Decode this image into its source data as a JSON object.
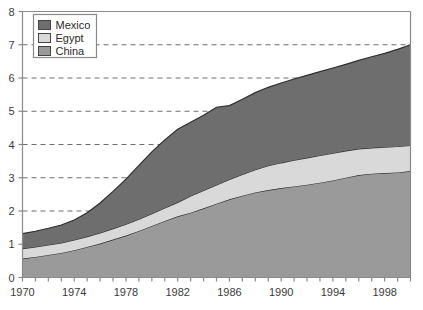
{
  "chart_data": {
    "type": "area",
    "stacked": true,
    "title": "",
    "xlabel": "",
    "ylabel": "",
    "xlim": [
      1970,
      2000
    ],
    "ylim": [
      0,
      8
    ],
    "ytick_values": [
      0,
      1,
      2,
      3,
      4,
      5,
      6,
      7,
      8
    ],
    "ytick_labels": [
      "0",
      "1",
      "2",
      "3",
      "4",
      "5",
      "6",
      "7",
      "8"
    ],
    "xtick_values": [
      1970,
      1971,
      1972,
      1973,
      1974,
      1975,
      1976,
      1977,
      1978,
      1979,
      1980,
      1981,
      1982,
      1983,
      1984,
      1985,
      1986,
      1987,
      1988,
      1989,
      1990,
      1991,
      1992,
      1993,
      1994,
      1995,
      1996,
      1997,
      1998,
      1999,
      2000
    ],
    "xtick_labels_shown": [
      "1970",
      "1974",
      "1978",
      "1982",
      "1986",
      "1990",
      "1994",
      "1998"
    ],
    "xtick_labels_years": [
      1970,
      1974,
      1978,
      1982,
      1986,
      1990,
      1994,
      1998
    ],
    "grid": "horizontal-dashed",
    "legend_position": "top-left",
    "x": [
      1970,
      1971,
      1972,
      1973,
      1974,
      1975,
      1976,
      1977,
      1978,
      1979,
      1980,
      1981,
      1982,
      1983,
      1984,
      1985,
      1986,
      1987,
      1988,
      1989,
      1990,
      1991,
      1992,
      1993,
      1994,
      1995,
      1996,
      1997,
      1998,
      1999,
      2000
    ],
    "series": [
      {
        "name": "China",
        "color": "#9a9a9a",
        "stack_order": 1,
        "values": [
          0.57,
          0.62,
          0.68,
          0.74,
          0.82,
          0.92,
          1.02,
          1.14,
          1.26,
          1.4,
          1.55,
          1.7,
          1.84,
          1.95,
          2.08,
          2.22,
          2.35,
          2.46,
          2.56,
          2.63,
          2.69,
          2.74,
          2.79,
          2.85,
          2.92,
          3.0,
          3.08,
          3.12,
          3.14,
          3.16,
          3.2
        ]
      },
      {
        "name": "Egypt",
        "color": "#d9d9d9",
        "stack_order": 2,
        "values": [
          0.3,
          0.3,
          0.3,
          0.3,
          0.31,
          0.31,
          0.32,
          0.33,
          0.34,
          0.35,
          0.37,
          0.39,
          0.42,
          0.5,
          0.54,
          0.56,
          0.6,
          0.64,
          0.68,
          0.73,
          0.76,
          0.79,
          0.81,
          0.82,
          0.82,
          0.81,
          0.79,
          0.78,
          0.78,
          0.78,
          0.77
        ]
      },
      {
        "name": "Mexico",
        "color": "#6e6e6e",
        "stack_order": 3,
        "values": [
          0.45,
          0.47,
          0.5,
          0.54,
          0.6,
          0.72,
          0.9,
          1.12,
          1.36,
          1.62,
          1.86,
          2.05,
          2.2,
          2.22,
          2.26,
          2.34,
          2.22,
          2.26,
          2.32,
          2.36,
          2.4,
          2.44,
          2.48,
          2.52,
          2.56,
          2.6,
          2.66,
          2.74,
          2.82,
          2.92,
          3.03
        ]
      }
    ],
    "cumulative_totals": [
      1.32,
      1.39,
      1.48,
      1.58,
      1.73,
      1.95,
      2.24,
      2.59,
      2.96,
      3.37,
      3.78,
      4.14,
      4.46,
      4.67,
      4.88,
      5.12,
      5.17,
      5.36,
      5.56,
      5.72,
      5.85,
      5.97,
      6.08,
      6.19,
      6.3,
      6.41,
      6.53,
      6.64,
      6.74,
      6.86,
      7.0
    ]
  },
  "legend": {
    "items": [
      {
        "label": "Mexico",
        "color": "#6e6e6e"
      },
      {
        "label": "Egypt",
        "color": "#d9d9d9"
      },
      {
        "label": "China",
        "color": "#9a9a9a"
      }
    ]
  },
  "axis_colors": {
    "axis_line": "#8a8a8a",
    "grid_line": "#6e6e6e",
    "tick_text": "#3a3a3a",
    "series_outline": "#2e2e2e"
  }
}
